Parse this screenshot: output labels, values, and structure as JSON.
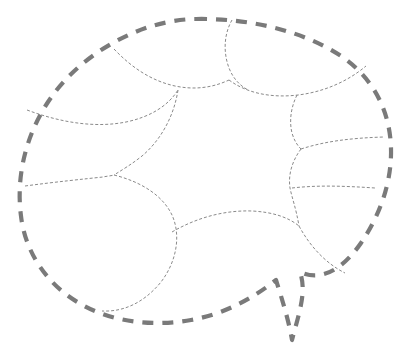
{
  "figure": {
    "title": "Dashed boundary region with interior cell partition",
    "type": "line-diagram",
    "width": 413,
    "height": 348,
    "background_color": "#ffffff"
  },
  "style": {
    "boundary_color": "#7a7a7a",
    "boundary_width": 4.2,
    "boundary_dash": "11 9",
    "interior_color": "#8a8a8a",
    "interior_width": 1.0,
    "interior_dash": "3 2"
  },
  "outer_boundary": {
    "name": "outer-dashed-contour",
    "description": "Closed dashed oval contour with a narrow V-shaped spike at lower right",
    "path": "M 196 19 C 252 18 305 32 341 56 C 375 79 390 113 391 148 C 392 182 380 215 361 243 C 345 266 323 283 300 272 C 307 292 299 313 292 340 C 289 322 283 302 276 280 C 252 299 224 314 191 320 C 152 327 111 322 79 303 C 46 284 25 251 21 216 C 16 178 25 137 48 102 C 72 65 113 38 152 26 C 166 22 181 19 196 19 Z"
  },
  "interior_curves": [
    {
      "name": "interior-curve-top-left-arc",
      "description": "Arc from upper-left boundary sweeping right to mid-top junction",
      "path": "M 114 49 C 132 68 152 81 175 86 C 194 90 212 88 229 80"
    },
    {
      "name": "interior-curve-top-center-stem",
      "description": "Curve descending from top boundary near x=232 into the upper middle junction",
      "path": "M 232 20 C 224 34 223 52 229 68 C 233 78 239 85 248 90"
    },
    {
      "name": "interior-curve-upper-right-lobe",
      "description": "Long lobe running from upper middle junction rightward to the right boundary",
      "path": "M 229 80 C 248 94 273 98 298 95 C 323 92 347 82 366 66"
    },
    {
      "name": "interior-curve-left-upper-rib",
      "description": "Rib from left boundary running right then curving down into the left triple junction",
      "path": "M 27 110 C 62 123 96 128 126 122 C 150 117 168 106 178 90"
    },
    {
      "name": "interior-curve-left-mid-descend",
      "description": "Curve from mid upper area descending to the left triple junction",
      "path": "M 178 90 C 174 116 161 140 142 156 C 132 164 122 170 114 175"
    },
    {
      "name": "interior-curve-left-lower-rib",
      "description": "Rib from left boundary to the left triple junction",
      "path": "M 25 186 C 55 182 84 179 103 177 C 107 176 111 176 114 175"
    },
    {
      "name": "interior-curve-bottom-left-lobe",
      "description": "Large lobe from the left triple junction bending right and down to the bottom boundary",
      "path": "M 114 175 C 142 182 163 196 172 215 C 181 235 177 261 161 282 C 143 304 122 312 102 311"
    },
    {
      "name": "interior-curve-bottom-center-arc",
      "description": "Concave arc across the lower middle connecting bottom-left lobe to lower-right junction",
      "path": "M 172 232 C 196 218 224 210 252 211 C 272 212 288 217 299 226"
    },
    {
      "name": "interior-curve-right-upper-stem",
      "description": "Short vertical stem from upper-right lobe down to the right middle junction",
      "path": "M 297 95 C 291 107 289 121 292 133 C 294 140 297 145 301 149"
    },
    {
      "name": "interior-curve-right-mid-rib",
      "description": "Rib from right middle junction sweeping right to the right boundary",
      "path": "M 301 149 C 326 141 352 138 384 137"
    },
    {
      "name": "interior-curve-right-mid-descend",
      "description": "Curve descending from right middle junction to the lower-right junction",
      "path": "M 301 149 C 292 161 288 175 290 188 C 292 198 296 208 299 226"
    },
    {
      "name": "interior-curve-right-lower-rib",
      "description": "Rib from lower-right junction sweeping right to the right boundary",
      "path": "M 292 188 C 318 185 345 186 375 188"
    },
    {
      "name": "interior-curve-bottom-right-lobe",
      "description": "Lobe running from lower-right junction down-right to the boundary spike apex",
      "path": "M 299 226 C 311 248 327 264 345 273"
    }
  ],
  "junctions": [
    {
      "name": "junction-top-mid",
      "x": 229,
      "y": 80
    },
    {
      "name": "junction-upper-left",
      "x": 178,
      "y": 90
    },
    {
      "name": "junction-left-triple",
      "x": 114,
      "y": 175
    },
    {
      "name": "junction-right-mid",
      "x": 301,
      "y": 149
    },
    {
      "name": "junction-lower-right",
      "x": 299,
      "y": 226
    }
  ],
  "regions": [
    {
      "name": "region-center",
      "label": "central star-shaped cell"
    },
    {
      "name": "region-top-left",
      "label": "upper-left cell"
    },
    {
      "name": "region-top-right",
      "label": "upper-right cell"
    },
    {
      "name": "region-left",
      "label": "left cell"
    },
    {
      "name": "region-bottom-left",
      "label": "lower-left cell"
    },
    {
      "name": "region-right-upper",
      "label": "right upper cell"
    },
    {
      "name": "region-right-lower",
      "label": "right lower cell"
    },
    {
      "name": "region-bottom-right",
      "label": "lower-right cell"
    }
  ]
}
